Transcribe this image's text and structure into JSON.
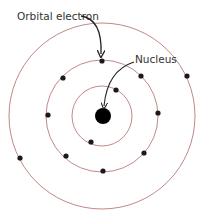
{
  "labels": {
    "orbital_electron": "Orbital electron",
    "nucleus": "Nucleus"
  },
  "colors": {
    "orbit": "#b06a6a",
    "electron": "#1a1a1a",
    "nucleus": "#000000",
    "arrow": "#222222",
    "text": "#333333"
  },
  "shells": [
    {
      "name": "inner",
      "electron_count": 2
    },
    {
      "name": "middle",
      "electron_count": 7
    },
    {
      "name": "outer",
      "electron_count": 2
    }
  ]
}
